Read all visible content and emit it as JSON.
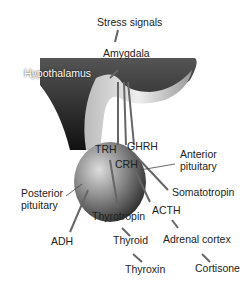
{
  "labels": {
    "stress": "Stress signals",
    "amygdala": "Amygdala",
    "hypothalamus": "Hypothalamus",
    "trh": "TRH",
    "ghrh": "GHRH",
    "crh": "CRH",
    "anterior1": "Anterior",
    "anterior2": "pituitary",
    "posterior1": "Posterior",
    "posterior2": "pituitary",
    "somatotropin": "Somatotropin",
    "acth": "ACTH",
    "thyrotropin": "Thyrotropin",
    "adh": "ADH",
    "thyroid": "Thyroid",
    "adrenal": "Adrenal cortex",
    "thyroxin": "Thyroxin",
    "cortisone": "Cortisone"
  }
}
